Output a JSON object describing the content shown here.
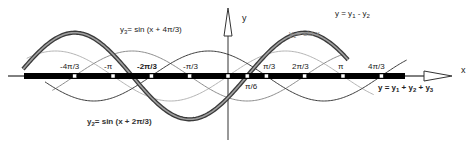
{
  "chart_data": {
    "type": "line",
    "title": "",
    "xlabel": "x",
    "ylabel": "y",
    "x_tick_labels": [
      "-4π/3",
      "-π",
      "-2π/3",
      "-π/3",
      "π/6",
      "π/3",
      "2π/3",
      "π",
      "4π/3"
    ],
    "x_tick_values": [
      -4.18879,
      -3.14159,
      -2.0944,
      -1.0472,
      0.5236,
      1.0472,
      2.0944,
      3.14159,
      4.18879
    ],
    "x_range": [
      -5.6,
      4.9
    ],
    "y_range": [
      -2.0,
      2.0
    ],
    "grid": false,
    "series": [
      {
        "name": "y1 = sin x",
        "expr": "sin(x)",
        "amplitude": 1,
        "phase": 0,
        "style": "thin-light-grey"
      },
      {
        "name": "y2 = sin (x + 2π/3)",
        "expr": "sin(x + 2π/3)",
        "amplitude": 1,
        "phase": 2.0944,
        "style": "thin-dark"
      },
      {
        "name": "y3 = sin (x + 4π/3)",
        "expr": "sin(x + 4π/3)",
        "amplitude": 1,
        "phase": 4.18879,
        "style": "thin-mid-grey"
      },
      {
        "name": "y = y1 - y2",
        "expr": "sqrt(3)·sin(x - π/6)",
        "amplitude": 1.732,
        "phase": -0.5236,
        "style": "thick-double"
      },
      {
        "name": "y = y1 + y2 + y3",
        "expr": "0",
        "amplitude": 0,
        "phase": 0,
        "style": "thick-black-on-axis"
      }
    ]
  },
  "labels": {
    "y_axis": "y",
    "x_axis": "x",
    "y1": {
      "main": "y",
      "sub": "1",
      "rest": "= sin x"
    },
    "y2": {
      "main": "y",
      "sub": "2",
      "rest": "= sin (x + 2π/3)"
    },
    "y3": {
      "main": "y",
      "sub": "3",
      "rest": "= sin (x + 4π/3)"
    },
    "diff": {
      "a": "y = y",
      "s1": "1",
      "b": " - y",
      "s2": "2"
    },
    "sum": {
      "a": "y = y",
      "s1": "1",
      "b": " + y",
      "s2": "2",
      "c": " + y",
      "s3": "3"
    },
    "ticks": {
      "m4pi3": "-4π/3",
      "mpi": "-π",
      "m2pi3": "-2π/3",
      "mpi3": "-π/3",
      "pi6": "π/6",
      "pi3": "π/3",
      "p2pi3": "2π/3",
      "pi": "π",
      "p4pi3": "4π/3"
    }
  },
  "colors": {
    "axis": "#000000",
    "y1": "#b4b4b4",
    "y2": "#3c3c3c",
    "y3": "#8c8c8c",
    "diff_outer": "#3a3a3a",
    "diff_inner": "#a0a0a0",
    "tick_marker": "#ffffff"
  }
}
